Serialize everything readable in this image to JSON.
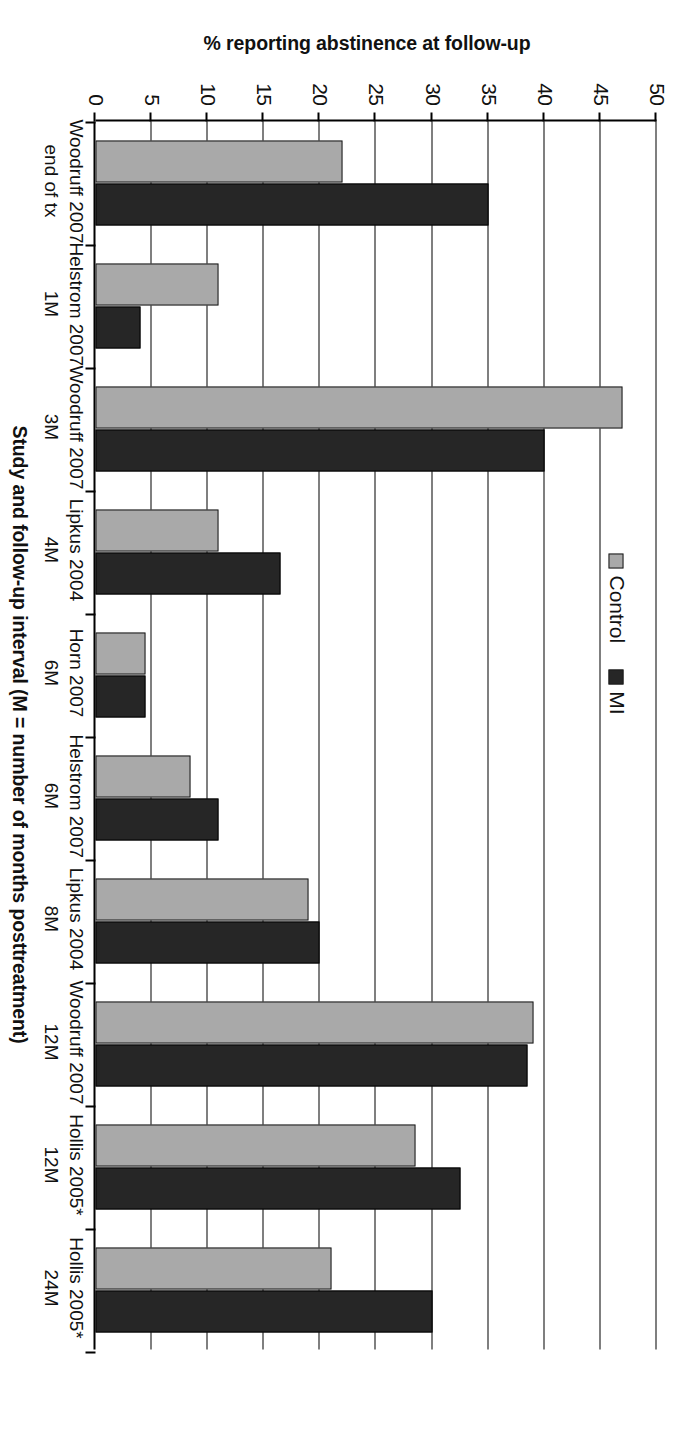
{
  "chart_data": {
    "type": "bar",
    "title": "",
    "xlabel": "Study and follow-up interval (M = number of months posttreatment)",
    "ylabel": "% reporting abstinence at follow-up",
    "ylim": [
      0,
      50
    ],
    "yticks": [
      0,
      5,
      10,
      15,
      20,
      25,
      30,
      35,
      40,
      45,
      50
    ],
    "ytick_labels": [
      "0",
      "5",
      "10",
      "15",
      "20",
      "25",
      "30",
      "35",
      "40",
      "45",
      "50"
    ],
    "grid": true,
    "legend_position": "top-center",
    "orientation": "vertical-bars",
    "page_rotation_degrees": 180,
    "categories": [
      {
        "line1": "Woodruff 2007",
        "line2": "end of tx"
      },
      {
        "line1": "Helstrom 2007",
        "line2": "1M"
      },
      {
        "line1": "Woodruff 2007",
        "line2": "3M"
      },
      {
        "line1": "Lipkus 2004",
        "line2": "4M"
      },
      {
        "line1": "Horn 2007",
        "line2": "6M"
      },
      {
        "line1": "Helstrom 2007",
        "line2": "6M"
      },
      {
        "line1": "Lipkus 2004",
        "line2": "8M"
      },
      {
        "line1": "Woodruff 2007",
        "line2": "12M"
      },
      {
        "line1": "Hollis 2005*",
        "line2": "12M"
      },
      {
        "line1": "Hollis 2005*",
        "line2": "24M"
      }
    ],
    "series": [
      {
        "name": "Control",
        "color": "#a9a9a9",
        "values": [
          22,
          11,
          47,
          11,
          4.5,
          8.5,
          19,
          39,
          28.5,
          21
        ]
      },
      {
        "name": "MI",
        "color": "#262626",
        "values": [
          35,
          4,
          40,
          16.5,
          4.5,
          11,
          20,
          38.5,
          32.5,
          30
        ]
      }
    ]
  }
}
